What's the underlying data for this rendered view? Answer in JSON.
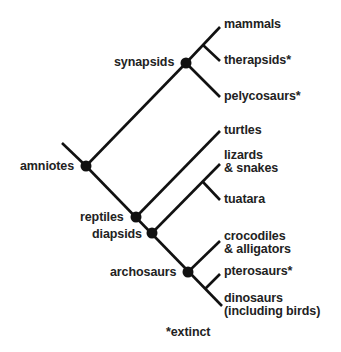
{
  "diagram": {
    "type": "cladogram",
    "colors": {
      "line": "#111111",
      "node": "#111111",
      "text": "#222222",
      "background": "#ffffff"
    },
    "internal_nodes": [
      {
        "id": "amniotes",
        "label": "amniotes",
        "x": 86,
        "y": 166
      },
      {
        "id": "synapsids",
        "label": "synapsids",
        "x": 186,
        "y": 63
      },
      {
        "id": "reptiles",
        "label": "reptiles",
        "x": 136,
        "y": 217
      },
      {
        "id": "diapsids",
        "label": "diapsids",
        "x": 152,
        "y": 233
      },
      {
        "id": "archosaurs",
        "label": "archosaurs",
        "x": 188,
        "y": 272
      }
    ],
    "taxa": [
      {
        "id": "mammals",
        "label": "mammals",
        "extinct": false
      },
      {
        "id": "therapsids",
        "label": "therapsids*",
        "extinct": true
      },
      {
        "id": "pelycosaurs",
        "label": "pelycosaurs*",
        "extinct": true
      },
      {
        "id": "turtles",
        "label": "turtles",
        "extinct": false
      },
      {
        "id": "lizards",
        "label_line1": "lizards",
        "label_line2": "& snakes",
        "extinct": false
      },
      {
        "id": "tuatara",
        "label": "tuatara",
        "extinct": false
      },
      {
        "id": "crocodiles",
        "label_line1": "crocodiles",
        "label_line2": "& alligators",
        "extinct": false
      },
      {
        "id": "pterosaurs",
        "label": "pterosaurs*",
        "extinct": true
      },
      {
        "id": "dinosaurs",
        "label_line1": "dinosaurs",
        "label_line2": "(including birds)",
        "extinct": false
      }
    ],
    "edges": [
      {
        "from": "root",
        "to": "amniotes"
      },
      {
        "from": "amniotes",
        "to": "synapsids"
      },
      {
        "from": "synapsids",
        "to": "mammals"
      },
      {
        "from": "synapsids",
        "to": "therapsids"
      },
      {
        "from": "synapsids",
        "to": "pelycosaurs"
      },
      {
        "from": "amniotes",
        "to": "reptiles"
      },
      {
        "from": "reptiles",
        "to": "turtles"
      },
      {
        "from": "reptiles",
        "to": "diapsids"
      },
      {
        "from": "diapsids",
        "to": "lizards"
      },
      {
        "from": "diapsids",
        "to": "tuatara"
      },
      {
        "from": "diapsids",
        "to": "archosaurs"
      },
      {
        "from": "archosaurs",
        "to": "crocodiles"
      },
      {
        "from": "archosaurs",
        "to": "pterosaurs"
      },
      {
        "from": "archosaurs",
        "to": "dinosaurs"
      }
    ],
    "footnote": "*extinct"
  }
}
